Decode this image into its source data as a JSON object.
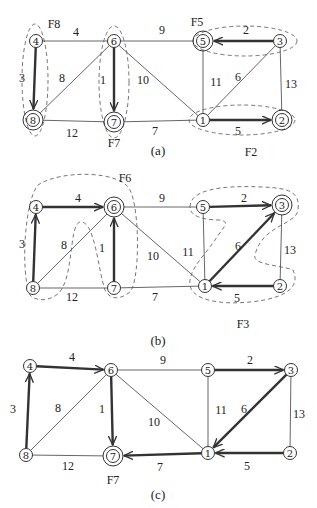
{
  "panels": [
    {
      "id": "a",
      "caption": "(a)",
      "caption_pos": [
        158,
        150
      ],
      "nodes": [
        {
          "id": "4",
          "x": 36,
          "y": 41,
          "ring": false
        },
        {
          "id": "6",
          "x": 114,
          "y": 41,
          "ring": false
        },
        {
          "id": "5",
          "x": 203,
          "y": 41,
          "ring": true
        },
        {
          "id": "3",
          "x": 280,
          "y": 41,
          "ring": false
        },
        {
          "id": "8",
          "x": 33,
          "y": 120,
          "ring": true
        },
        {
          "id": "7",
          "x": 114,
          "y": 122,
          "ring": true
        },
        {
          "id": "1",
          "x": 203,
          "y": 120,
          "ring": false
        },
        {
          "id": "2",
          "x": 282,
          "y": 120,
          "ring": true
        }
      ],
      "edges": [
        {
          "from": "4",
          "to": "6",
          "w": "4",
          "lx": 76,
          "ly": 32
        },
        {
          "from": "6",
          "to": "5",
          "w": "9",
          "lx": 162,
          "ly": 30
        },
        {
          "from": "8",
          "to": "7",
          "w": "12",
          "lx": 72,
          "ly": 133
        },
        {
          "from": "7",
          "to": "1",
          "w": "7",
          "lx": 155,
          "ly": 131
        },
        {
          "from": "6",
          "to": "8",
          "w": "8",
          "lx": 62,
          "ly": 78
        },
        {
          "from": "6",
          "to": "1",
          "w": "10",
          "lx": 143,
          "ly": 80
        },
        {
          "from": "5",
          "to": "1",
          "w": "11",
          "lx": 216,
          "ly": 82
        },
        {
          "from": "3",
          "to": "1",
          "w": "6",
          "lx": 238,
          "ly": 77
        },
        {
          "from": "3",
          "to": "2",
          "w": "13",
          "lx": 291,
          "ly": 84
        }
      ],
      "arcs": [
        {
          "from": "4",
          "to": "8",
          "w": "3",
          "lx": 22,
          "ly": 78
        },
        {
          "from": "6",
          "to": "7",
          "w": "1",
          "lx": 103,
          "ly": 80
        },
        {
          "from": "3",
          "to": "5",
          "w": "2",
          "lx": 246,
          "ly": 30
        },
        {
          "from": "1",
          "to": "2",
          "w": "5",
          "lx": 238,
          "ly": 131
        }
      ],
      "fragments": [
        {
          "label": "F8",
          "x": 54,
          "y": 24
        },
        {
          "label": "F7",
          "x": 114,
          "y": 143
        },
        {
          "label": "F5",
          "x": 197,
          "y": 22
        },
        {
          "label": "F2",
          "x": 251,
          "y": 152
        }
      ]
    },
    {
      "id": "b",
      "caption": "(b)",
      "caption_pos": [
        158,
        340
      ],
      "nodes": [
        {
          "id": "4",
          "x": 36,
          "y": 207,
          "ring": false
        },
        {
          "id": "6",
          "x": 114,
          "y": 207,
          "ring": true
        },
        {
          "id": "5",
          "x": 203,
          "y": 207,
          "ring": false
        },
        {
          "id": "3",
          "x": 282,
          "y": 205,
          "ring": true
        },
        {
          "id": "8",
          "x": 33,
          "y": 288,
          "ring": false
        },
        {
          "id": "7",
          "x": 114,
          "y": 288,
          "ring": false
        },
        {
          "id": "1",
          "x": 205,
          "y": 286,
          "ring": false
        },
        {
          "id": "2",
          "x": 280,
          "y": 286,
          "ring": false
        }
      ],
      "edges": [
        {
          "from": "6",
          "to": "5",
          "w": "9",
          "lx": 162,
          "ly": 198
        },
        {
          "from": "8",
          "to": "7",
          "w": "12",
          "lx": 72,
          "ly": 297
        },
        {
          "from": "7",
          "to": "1",
          "w": "7",
          "lx": 155,
          "ly": 297
        },
        {
          "from": "6",
          "to": "8",
          "w": "8",
          "lx": 64,
          "ly": 245
        },
        {
          "from": "6",
          "to": "1",
          "w": "10",
          "lx": 153,
          "ly": 256
        },
        {
          "from": "5",
          "to": "1",
          "w": "11",
          "lx": 188,
          "ly": 252
        },
        {
          "from": "3",
          "to": "2",
          "w": "13",
          "lx": 290,
          "ly": 250
        }
      ],
      "arcs": [
        {
          "from": "8",
          "to": "4",
          "w": "3",
          "lx": 22,
          "ly": 244
        },
        {
          "from": "4",
          "to": "6",
          "w": "4",
          "lx": 78,
          "ly": 198
        },
        {
          "from": "7",
          "to": "6",
          "w": "1",
          "lx": 102,
          "ly": 248
        },
        {
          "from": "5",
          "to": "3",
          "w": "2",
          "lx": 244,
          "ly": 198
        },
        {
          "from": "1",
          "to": "3",
          "w": "6",
          "lx": 238,
          "ly": 246
        },
        {
          "from": "2",
          "to": "1",
          "w": "5",
          "lx": 237,
          "ly": 298
        }
      ],
      "fragments": [
        {
          "label": "F6",
          "x": 125,
          "y": 178
        },
        {
          "label": "F3",
          "x": 243,
          "y": 324
        }
      ]
    },
    {
      "id": "c",
      "caption": "(c)",
      "caption_pos": [
        158,
        494
      ],
      "nodes": [
        {
          "id": "4",
          "x": 30,
          "y": 366,
          "ring": false
        },
        {
          "id": "6",
          "x": 111,
          "y": 370,
          "ring": false
        },
        {
          "id": "5",
          "x": 208,
          "y": 370,
          "ring": false
        },
        {
          "id": "3",
          "x": 291,
          "y": 370,
          "ring": false
        },
        {
          "id": "8",
          "x": 26,
          "y": 455,
          "ring": false
        },
        {
          "id": "7",
          "x": 113,
          "y": 456,
          "ring": true
        },
        {
          "id": "1",
          "x": 208,
          "y": 453,
          "ring": false
        },
        {
          "id": "2",
          "x": 290,
          "y": 453,
          "ring": false
        }
      ],
      "edges": [
        {
          "from": "6",
          "to": "5",
          "w": "9",
          "lx": 163,
          "ly": 360
        },
        {
          "from": "8",
          "to": "7",
          "w": "12",
          "lx": 68,
          "ly": 466
        },
        {
          "from": "6",
          "to": "8",
          "w": "8",
          "lx": 58,
          "ly": 408
        },
        {
          "from": "6",
          "to": "1",
          "w": "10",
          "lx": 154,
          "ly": 422
        },
        {
          "from": "5",
          "to": "1",
          "w": "11",
          "lx": 221,
          "ly": 410
        },
        {
          "from": "3",
          "to": "2",
          "w": "13",
          "lx": 299,
          "ly": 414
        }
      ],
      "arcs": [
        {
          "from": "8",
          "to": "4",
          "w": "3",
          "lx": 13,
          "ly": 409
        },
        {
          "from": "4",
          "to": "6",
          "w": "4",
          "lx": 72,
          "ly": 357
        },
        {
          "from": "6",
          "to": "7",
          "w": "1",
          "lx": 102,
          "ly": 409
        },
        {
          "from": "1",
          "to": "7",
          "w": "7",
          "lx": 160,
          "ly": 467
        },
        {
          "from": "5",
          "to": "3",
          "w": "2",
          "lx": 250,
          "ly": 360
        },
        {
          "from": "3",
          "to": "1",
          "w": "6",
          "lx": 244,
          "ly": 409
        },
        {
          "from": "2",
          "to": "1",
          "w": "5",
          "lx": 247,
          "ly": 466
        }
      ],
      "fragments": [
        {
          "label": "F7",
          "x": 113,
          "y": 480
        }
      ]
    }
  ],
  "dashed_regions": [
    {
      "name": "fragment-f8-region",
      "type": "ellipse",
      "cx": 35,
      "cy": 80,
      "rx": 13,
      "ry": 56
    },
    {
      "name": "fragment-f7-region",
      "type": "ellipse",
      "cx": 114,
      "cy": 82,
      "rx": 15,
      "ry": 56
    },
    {
      "name": "fragment-f5-region",
      "type": "ellipse",
      "cx": 245,
      "cy": 41,
      "rx": 52,
      "ry": 15
    },
    {
      "name": "fragment-f2-region",
      "type": "ellipse",
      "cx": 242,
      "cy": 120,
      "rx": 53,
      "ry": 15
    },
    {
      "name": "fragment-f6-region",
      "type": "path",
      "d": "M 30 295 C 20 270, 25 200, 38 185 C 60 170, 120 170, 130 190 C 140 210, 140 280, 130 292 C 120 300, 110 300, 105 290 C 98 270, 95 220, 80 222 C 68 225, 75 285, 55 296 C 45 302, 34 300, 30 295 Z"
    },
    {
      "name": "fragment-f3-region",
      "type": "path",
      "d": "M 190 207 C 190 190, 220 185, 262 187 C 290 188, 300 192, 298 210 C 296 225, 262 225, 255 255 C 252 265, 280 265, 293 270 C 300 285, 290 298, 250 302 C 220 305, 192 300, 190 285 C 188 270, 205 255, 215 240 C 225 225, 230 222, 220 220 C 200 220, 190 215, 190 207 Z"
    }
  ]
}
